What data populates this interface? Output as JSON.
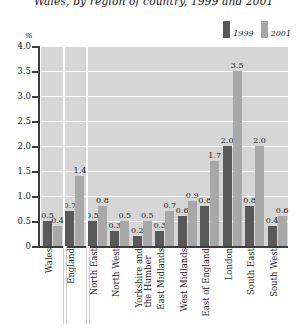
{
  "chart_data": {
    "type": "bar",
    "title": "Wales, by region of country, 1999 and 2001",
    "title_line1": "",
    "title_line2": "Wales, by region of country, 1999 and 2001",
    "xlabel": "",
    "ylabel": "%",
    "ylim": [
      0,
      4.0
    ],
    "yticks": [
      "0",
      "0.5",
      "1.0",
      "1.5",
      "2.0",
      "2.5",
      "3.0",
      "3.5",
      "4.0"
    ],
    "grid": true,
    "legend_position": "top-right",
    "categories": [
      "Wales",
      "England",
      "North East",
      "North West",
      "Yorkshire and\nthe Humber",
      "East Midlands",
      "West Midlands",
      "East of England",
      "London",
      "South East",
      "South West"
    ],
    "series": [
      {
        "name": "1999",
        "color": "#595959",
        "values": [
          0.5,
          0.7,
          0.5,
          0.3,
          0.2,
          0.3,
          0.6,
          0.8,
          2.0,
          0.8,
          0.4
        ]
      },
      {
        "name": "2001",
        "color": "#a8a8a8",
        "values": [
          0.4,
          1.4,
          0.8,
          0.5,
          0.5,
          0.7,
          0.9,
          1.7,
          3.5,
          2.0,
          0.6
        ]
      }
    ],
    "data_labels": [
      {
        "category": "Wales",
        "v1999": "0.5",
        "v2001": "0.4"
      },
      {
        "category": "England",
        "v1999": "0.7",
        "v2001": "1.4"
      },
      {
        "category": "North East",
        "v1999": "0.5",
        "v2001": "0.8"
      },
      {
        "category": "North West",
        "v1999": "0.3",
        "v2001": "0.5"
      },
      {
        "category": "Yorkshire and the Humber",
        "v1999": "0.2",
        "v2001": "0.5"
      },
      {
        "category": "East Midlands",
        "v1999": "0.3",
        "v2001": "0.7"
      },
      {
        "category": "West Midlands",
        "v1999": "0.6",
        "v2001": "0.9"
      },
      {
        "category": "East of England",
        "v1999": "0.8",
        "v2001": "1.7"
      },
      {
        "category": "London",
        "v1999": "2.0",
        "v2001": "3.5"
      },
      {
        "category": "South East",
        "v1999": "0.8",
        "v2001": "2.0"
      },
      {
        "category": "South West",
        "v1999": "0.4",
        "v2001": "0.6"
      }
    ],
    "panel_separators_after": [
      "Wales",
      "England"
    ],
    "plot_background": "#d6d6d6",
    "gridline_color": "#ffffff",
    "axis_color": "#3c3c3c"
  }
}
